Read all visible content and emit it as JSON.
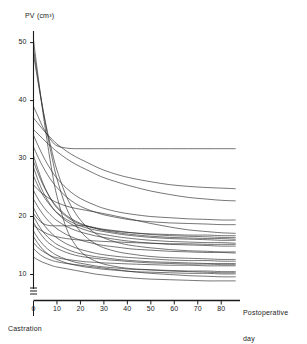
{
  "chart_data": {
    "type": "line",
    "title": "",
    "subtitle": "",
    "ylabel": "PV (cm³)",
    "xlabel": "Postoperative day",
    "xlabel_line1": "Postoperative",
    "xlabel_line2": "day",
    "annotation": "Castration",
    "annotation_x": 0,
    "grid": false,
    "legend": null,
    "legend_position": "none",
    "axis_break_y": true,
    "xlim": [
      0,
      88
    ],
    "ylim": [
      7.5,
      52
    ],
    "xticks": [
      0,
      10,
      20,
      30,
      40,
      50,
      60,
      70,
      80
    ],
    "xtick_labels": [
      "0",
      "10",
      "20",
      "30",
      "40",
      "50",
      "60",
      "70",
      "80"
    ],
    "yticks": [
      10,
      20,
      30,
      40,
      50
    ],
    "ytick_labels": [
      "10",
      "20",
      "30",
      "40",
      "50"
    ],
    "line_color": "#2b2b2b",
    "background_color": "#ffffff",
    "n_series": 25,
    "x": [
      0,
      2,
      4,
      6,
      8,
      10,
      14,
      18,
      22,
      26,
      30,
      36,
      42,
      50,
      58,
      66,
      74,
      80,
      86
    ],
    "series": [
      {
        "name": "patient-01",
        "values": [
          50.5,
          44.0,
          38.0,
          32.5,
          27.5,
          23.5,
          18.0,
          15.0,
          13.3,
          12.4,
          11.8,
          11.3,
          11.0,
          10.8,
          10.6,
          10.5,
          10.4,
          10.3,
          10.3
        ]
      },
      {
        "name": "patient-02",
        "values": [
          49.0,
          43.5,
          38.5,
          34.0,
          30.0,
          26.5,
          21.5,
          18.5,
          16.6,
          15.4,
          14.6,
          13.9,
          13.5,
          13.1,
          12.9,
          12.8,
          12.7,
          12.6,
          12.6
        ]
      },
      {
        "name": "patient-03",
        "values": [
          48.0,
          43.0,
          38.5,
          34.5,
          31.0,
          28.0,
          23.5,
          20.5,
          18.5,
          17.2,
          16.3,
          15.5,
          15.0,
          14.6,
          14.3,
          14.1,
          14.0,
          13.9,
          13.9
        ]
      },
      {
        "name": "patient-04",
        "values": [
          39.0,
          37.2,
          35.4,
          34.0,
          32.9,
          32.2,
          31.8,
          31.7,
          31.7,
          31.7,
          31.7,
          31.7,
          31.7,
          31.7,
          31.7,
          31.7,
          31.7,
          31.7,
          31.7
        ]
      },
      {
        "name": "patient-05",
        "values": [
          37.0,
          36.0,
          35.0,
          34.1,
          33.3,
          32.5,
          31.3,
          30.3,
          29.5,
          28.7,
          28.0,
          27.2,
          26.6,
          26.0,
          25.5,
          25.2,
          25.0,
          24.9,
          24.8
        ]
      },
      {
        "name": "patient-06",
        "values": [
          35.0,
          34.2,
          33.4,
          32.6,
          31.9,
          31.2,
          30.0,
          29.0,
          28.2,
          27.4,
          26.7,
          25.9,
          25.2,
          24.4,
          23.8,
          23.3,
          23.0,
          22.8,
          22.7
        ]
      },
      {
        "name": "patient-07",
        "values": [
          34.0,
          32.2,
          30.5,
          29.0,
          27.7,
          26.6,
          24.9,
          23.6,
          22.7,
          22.0,
          21.4,
          20.8,
          20.4,
          20.0,
          19.8,
          19.6,
          19.5,
          19.4,
          19.4
        ]
      },
      {
        "name": "patient-08",
        "values": [
          32.0,
          30.2,
          28.6,
          27.2,
          26.0,
          25.0,
          23.4,
          22.2,
          21.4,
          20.8,
          20.3,
          19.8,
          19.4,
          19.1,
          18.9,
          18.8,
          18.7,
          18.6,
          18.6
        ]
      },
      {
        "name": "patient-09",
        "values": [
          30.5,
          28.0,
          25.8,
          24.0,
          22.6,
          21.5,
          20.0,
          19.0,
          18.4,
          18.0,
          17.7,
          17.4,
          17.2,
          17.0,
          16.9,
          16.8,
          16.8,
          16.7,
          16.7
        ]
      },
      {
        "name": "patient-10",
        "values": [
          29.5,
          27.4,
          25.5,
          24.0,
          22.7,
          21.7,
          20.2,
          19.2,
          18.5,
          18.0,
          17.6,
          17.2,
          16.9,
          16.6,
          16.4,
          16.3,
          16.2,
          16.2,
          16.1
        ]
      },
      {
        "name": "patient-11",
        "values": [
          28.5,
          26.2,
          24.3,
          22.8,
          21.6,
          20.6,
          19.2,
          18.3,
          17.7,
          17.2,
          16.9,
          16.5,
          16.2,
          15.9,
          15.7,
          15.6,
          15.5,
          15.5,
          15.4
        ]
      },
      {
        "name": "patient-12",
        "values": [
          27.0,
          25.2,
          23.7,
          22.5,
          21.5,
          20.7,
          19.5,
          18.7,
          18.1,
          17.7,
          17.4,
          17.0,
          16.7,
          16.4,
          16.2,
          16.1,
          16.0,
          15.9,
          15.9
        ]
      },
      {
        "name": "patient-13",
        "values": [
          25.5,
          24.6,
          23.9,
          23.3,
          22.8,
          22.4,
          21.8,
          21.4,
          21.1,
          20.8,
          20.5,
          20.0,
          19.5,
          18.8,
          18.2,
          17.7,
          17.4,
          17.2,
          17.1
        ]
      },
      {
        "name": "patient-14",
        "values": [
          24.5,
          23.0,
          21.8,
          20.8,
          20.0,
          19.3,
          18.3,
          17.6,
          17.1,
          16.7,
          16.4,
          16.0,
          15.7,
          15.4,
          15.2,
          15.1,
          15.0,
          14.9,
          14.9
        ]
      },
      {
        "name": "patient-15",
        "values": [
          23.0,
          21.6,
          20.4,
          19.4,
          18.6,
          17.9,
          16.9,
          16.2,
          15.7,
          15.3,
          15.0,
          14.7,
          14.4,
          14.2,
          14.0,
          13.9,
          13.8,
          13.8,
          13.7
        ]
      },
      {
        "name": "patient-16",
        "values": [
          21.5,
          20.0,
          18.8,
          17.8,
          17.0,
          16.3,
          15.3,
          14.6,
          14.1,
          13.7,
          13.4,
          13.1,
          12.9,
          12.7,
          12.5,
          12.4,
          12.4,
          12.3,
          12.3
        ]
      },
      {
        "name": "patient-17",
        "values": [
          20.5,
          19.5,
          18.8,
          18.5,
          18.4,
          18.4,
          18.4,
          18.4,
          18.4,
          18.1,
          17.8,
          17.5,
          17.2,
          16.9,
          16.7,
          16.6,
          16.5,
          16.4,
          16.4
        ]
      },
      {
        "name": "patient-18",
        "values": [
          20.0,
          18.6,
          17.4,
          16.5,
          15.8,
          15.2,
          14.4,
          13.8,
          13.4,
          13.1,
          12.9,
          12.6,
          12.4,
          12.2,
          12.1,
          12.0,
          11.9,
          11.9,
          11.9
        ]
      },
      {
        "name": "patient-19",
        "values": [
          19.0,
          17.6,
          16.5,
          15.6,
          15.0,
          14.5,
          13.8,
          13.3,
          13.0,
          12.8,
          12.6,
          12.4,
          12.2,
          12.0,
          11.9,
          11.8,
          11.8,
          11.7,
          11.7
        ]
      },
      {
        "name": "patient-20",
        "values": [
          18.5,
          17.9,
          17.4,
          17.0,
          16.7,
          16.5,
          16.2,
          16.0,
          15.9,
          15.8,
          15.7,
          15.6,
          15.5,
          15.4,
          15.3,
          15.3,
          15.2,
          15.2,
          15.2
        ]
      },
      {
        "name": "patient-21",
        "values": [
          17.5,
          16.2,
          15.2,
          14.4,
          13.8,
          13.3,
          12.6,
          12.1,
          11.8,
          11.5,
          11.3,
          11.1,
          10.9,
          10.8,
          10.7,
          10.6,
          10.6,
          10.5,
          10.5
        ]
      },
      {
        "name": "patient-22",
        "values": [
          16.5,
          15.3,
          14.3,
          13.6,
          13.0,
          12.6,
          12.0,
          11.6,
          11.3,
          11.1,
          10.9,
          10.7,
          10.5,
          10.4,
          10.3,
          10.2,
          10.2,
          10.1,
          10.1
        ]
      },
      {
        "name": "patient-23",
        "values": [
          15.5,
          14.6,
          14.0,
          13.5,
          13.1,
          12.9,
          12.6,
          12.4,
          12.2,
          12.1,
          12.0,
          11.9,
          11.8,
          11.7,
          11.6,
          11.6,
          11.5,
          11.5,
          11.5
        ]
      },
      {
        "name": "patient-24",
        "values": [
          14.5,
          13.7,
          13.1,
          12.7,
          12.4,
          12.2,
          11.9,
          11.7,
          11.5,
          11.3,
          11.1,
          10.8,
          10.5,
          10.2,
          10.0,
          9.8,
          9.7,
          9.6,
          9.6
        ]
      },
      {
        "name": "patient-25",
        "values": [
          13.0,
          12.5,
          12.1,
          11.8,
          11.5,
          11.3,
          11.0,
          10.7,
          10.4,
          10.1,
          9.9,
          9.6,
          9.4,
          9.2,
          9.1,
          9.0,
          8.9,
          8.9,
          8.9
        ]
      }
    ]
  },
  "axes": {
    "y_title": "PV (cm³)",
    "x_title_line1": "Postoperative",
    "x_title_line2": "day"
  },
  "annotations": {
    "castration": "Castration"
  }
}
